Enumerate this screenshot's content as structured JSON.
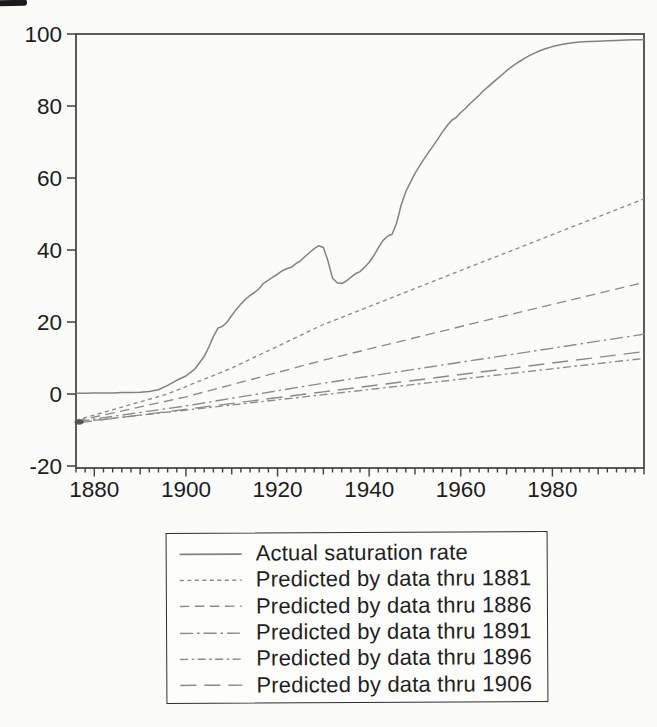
{
  "chart_data": {
    "type": "line",
    "title": "",
    "xlabel": "",
    "ylabel": "",
    "grid": false,
    "legend_position": "below-chart",
    "x_axis": {
      "range": [
        1876,
        2000
      ],
      "major_ticks": [
        1880,
        1900,
        1920,
        1940,
        1960,
        1980
      ],
      "major_tick_labels": [
        "1880",
        "1900",
        "1920",
        "1940",
        "1960",
        "1980"
      ],
      "minor_tick_step_years": 2,
      "decade_tick_step_years": 10
    },
    "y_axis": {
      "range": [
        -20.6,
        100
      ],
      "ticks": [
        100,
        80,
        60,
        40,
        20,
        0,
        -20
      ],
      "tick_labels": [
        "100",
        "80",
        "60",
        "40",
        "20",
        "0",
        "-20"
      ]
    },
    "series": [
      {
        "name": "Actual saturation rate",
        "style": "solid",
        "dash": "",
        "points": [
          [
            1876,
            0.2
          ],
          [
            1878,
            0.2
          ],
          [
            1880,
            0.3
          ],
          [
            1882,
            0.3
          ],
          [
            1884,
            0.3
          ],
          [
            1886,
            0.4
          ],
          [
            1888,
            0.4
          ],
          [
            1890,
            0.5
          ],
          [
            1892,
            0.7
          ],
          [
            1894,
            1.2
          ],
          [
            1896,
            2.4
          ],
          [
            1898,
            3.8
          ],
          [
            1900,
            5.0
          ],
          [
            1902,
            7.0
          ],
          [
            1904,
            10.5
          ],
          [
            1905,
            13.0
          ],
          [
            1906,
            16.0
          ],
          [
            1907,
            18.3
          ],
          [
            1908,
            18.8
          ],
          [
            1909,
            20.0
          ],
          [
            1910,
            21.8
          ],
          [
            1911,
            23.5
          ],
          [
            1912,
            25.0
          ],
          [
            1913,
            26.3
          ],
          [
            1914,
            27.4
          ],
          [
            1915,
            28.2
          ],
          [
            1916,
            29.3
          ],
          [
            1917,
            30.8
          ],
          [
            1918,
            31.6
          ],
          [
            1919,
            32.5
          ],
          [
            1920,
            33.3
          ],
          [
            1921,
            34.2
          ],
          [
            1922,
            34.8
          ],
          [
            1923,
            35.2
          ],
          [
            1924,
            36.2
          ],
          [
            1925,
            37.0
          ],
          [
            1926,
            38.2
          ],
          [
            1927,
            39.3
          ],
          [
            1928,
            40.4
          ],
          [
            1929,
            41.2
          ],
          [
            1930,
            40.7
          ],
          [
            1931,
            37.0
          ],
          [
            1932,
            32.2
          ],
          [
            1933,
            30.9
          ],
          [
            1934,
            30.7
          ],
          [
            1935,
            31.4
          ],
          [
            1936,
            32.4
          ],
          [
            1937,
            33.4
          ],
          [
            1938,
            34.0
          ],
          [
            1939,
            35.2
          ],
          [
            1940,
            36.6
          ],
          [
            1941,
            38.4
          ],
          [
            1942,
            40.6
          ],
          [
            1943,
            42.6
          ],
          [
            1944,
            43.8
          ],
          [
            1945,
            44.4
          ],
          [
            1946,
            47.5
          ],
          [
            1947,
            52.5
          ],
          [
            1948,
            56.2
          ],
          [
            1949,
            58.8
          ],
          [
            1950,
            61.3
          ],
          [
            1951,
            63.3
          ],
          [
            1952,
            65.3
          ],
          [
            1953,
            67.2
          ],
          [
            1954,
            69.0
          ],
          [
            1955,
            70.9
          ],
          [
            1956,
            72.8
          ],
          [
            1957,
            74.5
          ],
          [
            1958,
            76.0
          ],
          [
            1959,
            76.8
          ],
          [
            1960,
            78.2
          ],
          [
            1961,
            79.3
          ],
          [
            1962,
            80.6
          ],
          [
            1963,
            81.8
          ],
          [
            1964,
            83.0
          ],
          [
            1965,
            84.3
          ],
          [
            1966,
            85.4
          ],
          [
            1967,
            86.5
          ],
          [
            1968,
            87.6
          ],
          [
            1969,
            88.7
          ],
          [
            1970,
            89.8
          ],
          [
            1971,
            90.8
          ],
          [
            1972,
            91.7
          ],
          [
            1973,
            92.5
          ],
          [
            1974,
            93.3
          ],
          [
            1975,
            94.0
          ],
          [
            1976,
            94.6
          ],
          [
            1977,
            95.2
          ],
          [
            1978,
            95.7
          ],
          [
            1979,
            96.1
          ],
          [
            1980,
            96.5
          ],
          [
            1982,
            97.1
          ],
          [
            1984,
            97.5
          ],
          [
            1986,
            97.8
          ],
          [
            1988,
            97.9
          ],
          [
            1990,
            98.0
          ],
          [
            1992,
            98.1
          ],
          [
            1994,
            98.2
          ],
          [
            1996,
            98.3
          ],
          [
            1998,
            98.4
          ],
          [
            2000,
            98.4
          ]
        ]
      },
      {
        "name": "Predicted by data thru 1881",
        "style": "short-dash",
        "dash": "4 3.5",
        "points": [
          [
            1876,
            -7.3
          ],
          [
            1896,
            0.0
          ],
          [
            1910,
            7.2
          ],
          [
            1930,
            19.3
          ],
          [
            1965,
            36.8
          ],
          [
            2000,
            54.2
          ]
        ]
      },
      {
        "name": "Predicted by data thru 1886",
        "style": "medium-dash",
        "dash": "9.5 5.5",
        "points": [
          [
            1876,
            -7.5
          ],
          [
            1900,
            -0.8
          ],
          [
            1930,
            9.4
          ],
          [
            1965,
            20.3
          ],
          [
            2000,
            31.0
          ]
        ]
      },
      {
        "name": "Predicted by data thru 1891",
        "style": "dash-dot",
        "dash": "13 4 2.5 4",
        "points": [
          [
            1876,
            -7.7
          ],
          [
            1900,
            -3.3
          ],
          [
            1930,
            3.0
          ],
          [
            2000,
            16.6
          ]
        ]
      },
      {
        "name": "Predicted by data thru 1896",
        "style": "dash-dot-short",
        "dash": "8 3.5 2.5 3.5",
        "points": [
          [
            1876,
            -7.9
          ],
          [
            1930,
            -0.2
          ],
          [
            2000,
            9.9
          ]
        ]
      },
      {
        "name": "Predicted by data thru 1906",
        "style": "long-dash",
        "dash": "16 8",
        "points": [
          [
            1876,
            -8.1
          ],
          [
            1930,
            0.6
          ],
          [
            2000,
            11.8
          ]
        ]
      }
    ]
  },
  "colors": {
    "paper": "#fbfbf9",
    "frame": "#3f3f3f",
    "tick": "#3f3f3f",
    "text": "#1c1c1c",
    "line_gray": "#828282",
    "prediction_gray": "#8a8a8a",
    "legend_border": "#2e2e2e",
    "ink_knot": "#4a4a4a"
  },
  "layout_px": {
    "plot_left": 76,
    "plot_top": 34,
    "plot_right": 644,
    "plot_bottom": 468
  }
}
